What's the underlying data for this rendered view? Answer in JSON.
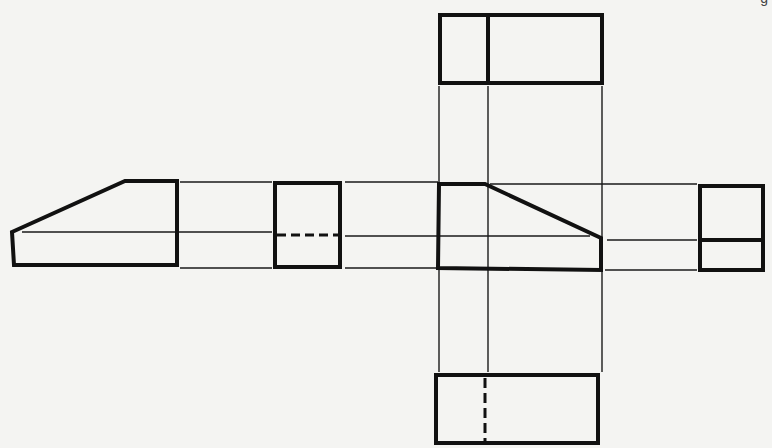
{
  "figure": {
    "corner_glyph": "g",
    "colors": {
      "background": "#f4f4f2",
      "line": "#111111"
    },
    "views": [
      {
        "id": "left-side-view",
        "description": "Trapezoid profile, slope rising to the right"
      },
      {
        "id": "left-end-view",
        "description": "Rectangle with horizontal hidden line"
      },
      {
        "id": "front-view",
        "description": "Trapezoid profile, slope falling to the right"
      },
      {
        "id": "right-end-view",
        "description": "Rectangle with horizontal visible line"
      },
      {
        "id": "top-view",
        "description": "Rectangle with vertical visible line"
      },
      {
        "id": "bottom-view",
        "description": "Rectangle with vertical hidden line"
      }
    ],
    "projection_lines": {
      "horizontal": 3,
      "vertical": 3
    }
  }
}
